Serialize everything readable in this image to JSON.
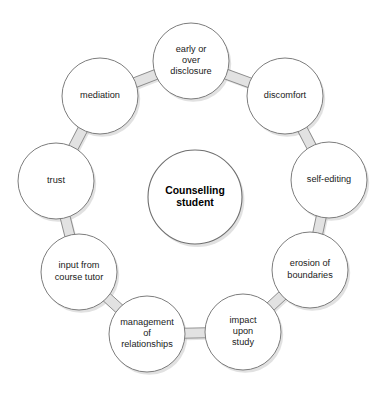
{
  "diagram": {
    "type": "cycle",
    "title_visible": false,
    "background_color": "#ffffff",
    "node_fill": "#ffffff",
    "node_stroke": "#7d7d7d",
    "connector_fill": "#e2e2e2",
    "text_color": "#1a1a1a",
    "canvas": {
      "width": 385,
      "height": 394
    },
    "ring": {
      "center_x": 195,
      "center_y": 197,
      "radius": 119,
      "node_radius": 38
    },
    "center_node": {
      "id": "counselling-student",
      "label": "Counselling student",
      "lines": [
        "Counselling",
        "student"
      ],
      "bold": true,
      "cx": 195,
      "cy": 197,
      "r": 47
    },
    "nodes": [
      {
        "id": "early-or-over-disclosure",
        "label": "early or over disclosure",
        "lines": [
          "early or",
          "over",
          "disclosure"
        ],
        "cx": 191,
        "cy": 61,
        "angle_deg": -88
      },
      {
        "id": "discomfort",
        "label": "discomfort",
        "lines": [
          "discomfort"
        ],
        "cx": 285,
        "cy": 96,
        "angle_deg": -42
      },
      {
        "id": "self-editing",
        "label": "self-editing",
        "lines": [
          "self-editing"
        ],
        "cx": 329,
        "cy": 180,
        "angle_deg": -8
      },
      {
        "id": "erosion-of-boundaries",
        "label": "erosion of boundaries",
        "lines": [
          "erosion of",
          "boundaries"
        ],
        "cx": 310,
        "cy": 270,
        "angle_deg": 33
      },
      {
        "id": "impact-upon-study",
        "label": "impact upon study",
        "lines": [
          "impact",
          "upon",
          "study"
        ],
        "cx": 243,
        "cy": 332,
        "angle_deg": 69
      },
      {
        "id": "management-of-relationships",
        "label": "management of relationships",
        "lines": [
          "management",
          "of",
          "relationships"
        ],
        "cx": 147,
        "cy": 334,
        "angle_deg": 111
      },
      {
        "id": "input-from-course-tutor",
        "label": "input from course tutor",
        "lines": [
          "input from",
          "course tutor"
        ],
        "cx": 79,
        "cy": 272,
        "angle_deg": 147
      },
      {
        "id": "trust",
        "label": "trust",
        "lines": [
          "trust"
        ],
        "cx": 56,
        "cy": 181,
        "angle_deg": 188
      },
      {
        "id": "mediation",
        "label": "mediation",
        "lines": [
          "mediation"
        ],
        "cx": 100,
        "cy": 96,
        "angle_deg": 228
      }
    ],
    "connectors": [
      {
        "from": "early-or-over-disclosure",
        "to": "discomfort"
      },
      {
        "from": "discomfort",
        "to": "self-editing"
      },
      {
        "from": "self-editing",
        "to": "erosion-of-boundaries"
      },
      {
        "from": "erosion-of-boundaries",
        "to": "impact-upon-study"
      },
      {
        "from": "impact-upon-study",
        "to": "management-of-relationships"
      },
      {
        "from": "management-of-relationships",
        "to": "input-from-course-tutor"
      },
      {
        "from": "input-from-course-tutor",
        "to": "trust"
      },
      {
        "from": "trust",
        "to": "mediation"
      },
      {
        "from": "mediation",
        "to": "early-or-over-disclosure"
      }
    ]
  }
}
